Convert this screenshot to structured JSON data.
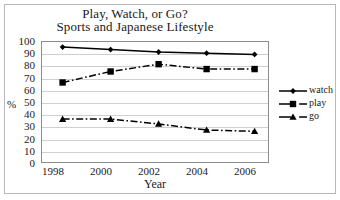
{
  "chart_data": {
    "type": "line",
    "title": "Play, Watch, or Go?",
    "subtitle": "Sports and Japanese Lifestyle",
    "xlabel": "Year",
    "ylabel": "%",
    "xlim": [
      1997.5,
      2007.0
    ],
    "ylim": [
      0,
      100
    ],
    "ytick_step": 10,
    "grid": true,
    "legend_position": "right",
    "xticks": [
      "1998",
      "2000",
      "2002",
      "2004",
      "2006"
    ],
    "xtick_values": [
      1998,
      2000,
      2002,
      2004,
      2006
    ],
    "yticks": [
      "0",
      "10",
      "20",
      "30",
      "40",
      "50",
      "60",
      "70",
      "80",
      "90",
      "100"
    ],
    "ytick_values": [
      0,
      10,
      20,
      30,
      40,
      50,
      60,
      70,
      80,
      90,
      100
    ],
    "x": [
      1998.4,
      2000.4,
      2002.4,
      2004.4,
      2006.4
    ],
    "series": [
      {
        "name": "watch",
        "values": [
          95,
          93,
          91,
          90,
          89
        ],
        "marker": "diamond",
        "linestyle": "solid",
        "color": "#000000"
      },
      {
        "name": "play",
        "values": [
          66,
          75,
          81,
          77,
          77
        ],
        "marker": "square",
        "linestyle": "dash-dot",
        "color": "#000000"
      },
      {
        "name": "go",
        "values": [
          36,
          36,
          32,
          27,
          26
        ],
        "marker": "triangle",
        "linestyle": "dash-dot",
        "color": "#000000"
      }
    ]
  },
  "legend": {
    "entries": [
      {
        "label": "watch"
      },
      {
        "label": "play"
      },
      {
        "label": "go"
      }
    ]
  },
  "colors": {
    "ink": "#000000",
    "grid": "#cfcfcf",
    "axis": "#8c8c8c",
    "frame": "#b9b9b9",
    "background": "#ffffff"
  }
}
